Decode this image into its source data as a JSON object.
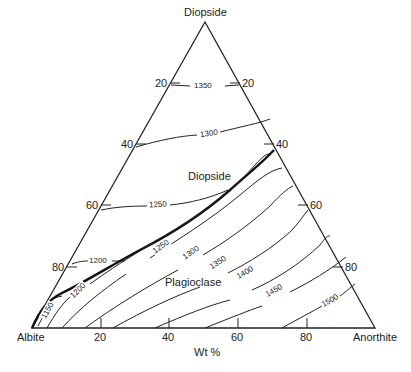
{
  "diagram": {
    "title": "",
    "type": "ternary-phase-diagram",
    "vertices": {
      "top": "Diopside",
      "left": "Albite",
      "right": "Anorthite"
    },
    "regions": {
      "upper": "Diopside",
      "lower": "Plagioclase"
    },
    "axis_unit": "Wt %",
    "left_edge_ticks": [
      "20",
      "40",
      "60",
      "80"
    ],
    "right_edge_ticks": [
      "20",
      "40",
      "60",
      "80"
    ],
    "base_ticks": [
      "20",
      "40",
      "60",
      "80"
    ],
    "isotherms_diopside_field": [
      "1350",
      "1300",
      "1250",
      "1200"
    ],
    "isotherms_plagioclase_field": [
      "1150",
      "1200",
      "1250",
      "1300",
      "1350",
      "1400",
      "1450",
      "1500"
    ],
    "cotectic_line": "bold boundary curve from Albite corner to ~Di42 on Diopside–Anorthite join"
  }
}
